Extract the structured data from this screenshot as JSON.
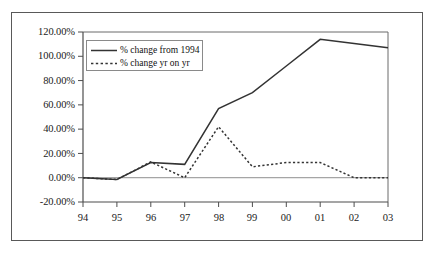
{
  "chart_data": {
    "type": "line",
    "title": "",
    "subtitle": "",
    "xlabel": "",
    "ylabel": "",
    "categories": [
      "94",
      "95",
      "96",
      "97",
      "98",
      "99",
      "00",
      "01",
      "02",
      "03"
    ],
    "x_tick_labels": [
      "94",
      "95",
      "96",
      "97",
      "98",
      "99",
      "00",
      "01",
      "02",
      "03"
    ],
    "y_tick_labels": [
      "-20.00%",
      "0.00%",
      "20.00%",
      "40.00%",
      "60.00%",
      "80.00%",
      "100.00%",
      "120.00%"
    ],
    "y_tick_values": [
      -20,
      0,
      20,
      40,
      60,
      80,
      100,
      120
    ],
    "ylim": [
      -20,
      120
    ],
    "y_units": "percent",
    "grid": false,
    "zero_line": true,
    "legend_position": "top-left inside plot",
    "series": [
      {
        "name": "% change from 1994",
        "style": "solid",
        "color": "#333333",
        "values": [
          0,
          -1.5,
          12.5,
          11,
          57,
          70,
          92,
          114,
          110.5,
          107
        ]
      },
      {
        "name": "% change yr on yr",
        "style": "dotted",
        "color": "#333333",
        "values": [
          0,
          -1.5,
          13,
          0,
          42,
          9,
          12.5,
          12.5,
          0,
          0
        ]
      }
    ]
  },
  "legend": {
    "items": [
      {
        "label": "% change from 1994",
        "style": "solid"
      },
      {
        "label": "% change yr on yr",
        "style": "dotted"
      }
    ]
  },
  "axes": {
    "y_labels": [
      "120.00%",
      "100.00%",
      "80.00%",
      "60.00%",
      "40.00%",
      "20.00%",
      "0.00%",
      "-20.00%"
    ],
    "x_labels": [
      "94",
      "95",
      "96",
      "97",
      "98",
      "99",
      "00",
      "01",
      "02",
      "03"
    ]
  }
}
